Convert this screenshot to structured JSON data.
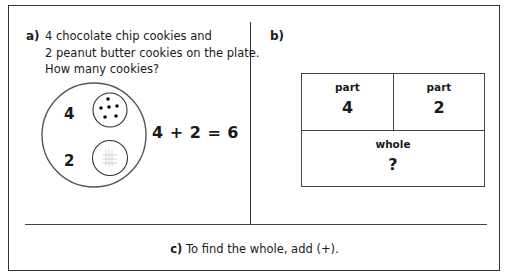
{
  "section_a": {
    "label": "a)",
    "lines": [
      "4 chocolate chip cookies and",
      "2 peanut butter cookies on the plate.",
      "How many cookies?"
    ],
    "plate": {
      "chocolate_count": "4",
      "peanut_count": "2",
      "chocolate_cookie_icon": "cookie-with-chips",
      "peanut_cookie_icon": "cookie-with-crosshatch"
    },
    "equation": "4 + 2 = 6"
  },
  "section_b": {
    "label": "b)",
    "table": {
      "part_left_header": "part",
      "part_left_value": "4",
      "part_right_header": "part",
      "part_right_value": "2",
      "whole_header": "whole",
      "whole_value": "?"
    }
  },
  "section_c": {
    "label": "c)",
    "text": "To find the whole, add (+)."
  }
}
